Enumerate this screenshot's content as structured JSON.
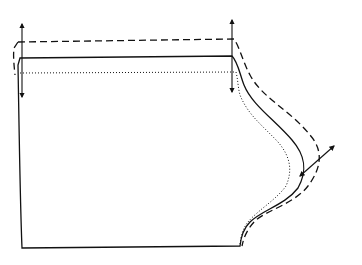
{
  "diagram": {
    "type": "sewing-pattern-grading",
    "background": "#ffffff",
    "stroke_color": "#111111",
    "lines": [
      {
        "name": "original-outline",
        "style": "solid"
      },
      {
        "name": "enlarged-outline",
        "style": "dashed"
      },
      {
        "name": "reduced-outline",
        "style": "dotted"
      }
    ],
    "arrows": [
      {
        "name": "left-vertical-grading-arrow",
        "direction": "up-down"
      },
      {
        "name": "right-vertical-grading-arrow",
        "direction": "up-down"
      },
      {
        "name": "curve-diagonal-grading-arrow",
        "direction": "diagonal"
      }
    ]
  }
}
